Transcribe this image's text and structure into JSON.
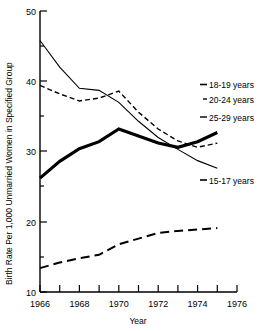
{
  "chart_data": {
    "type": "line",
    "title": "",
    "xlabel": "Year",
    "ylabel": "Birth Rate Per 1,000 Unmarried Women in Specified Group",
    "xlim": [
      1966,
      1976
    ],
    "ylim": [
      10,
      50
    ],
    "yticks": [
      10,
      20,
      30,
      40,
      50
    ],
    "ytick_labels": [
      "10",
      "20",
      "30",
      "40",
      "50"
    ],
    "xticks": [
      1966,
      1967,
      1968,
      1969,
      1970,
      1971,
      1972,
      1973,
      1974,
      1975,
      1976
    ],
    "xtick_labels": [
      "1966",
      "",
      "1968",
      "",
      "1970",
      "",
      "1972",
      "",
      "1974",
      "",
      "1976"
    ],
    "grid": false,
    "legend_position": "right-inline",
    "x": [
      1966,
      1967,
      1968,
      1969,
      1970,
      1971,
      1972,
      1973,
      1974,
      1975
    ],
    "series": [
      {
        "name": "18-19 years",
        "label": "18-19 years",
        "style": "solid-thin",
        "color": "#000000",
        "values": [
          45.8,
          42.0,
          39.0,
          38.7,
          37.0,
          34.3,
          32.0,
          30.3,
          28.7,
          27.6
        ]
      },
      {
        "name": "20-24 years",
        "label": "20-24 years",
        "style": "dashed-short",
        "color": "#000000",
        "values": [
          39.4,
          38.2,
          37.2,
          37.6,
          38.6,
          35.6,
          33.2,
          31.5,
          30.6,
          31.2
        ]
      },
      {
        "name": "25-29 years",
        "label": "25-29 years",
        "style": "solid-thick",
        "color": "#000000",
        "values": [
          26.2,
          28.6,
          30.4,
          31.4,
          33.2,
          32.2,
          31.2,
          30.6,
          31.4,
          32.7
        ]
      },
      {
        "name": "15-17 years",
        "label": "15-17 years",
        "style": "dashed-long",
        "color": "#000000",
        "values": [
          13.4,
          14.2,
          14.8,
          15.3,
          16.8,
          17.6,
          18.4,
          18.7,
          18.9,
          19.1
        ]
      }
    ]
  },
  "axis": {
    "y_title": "Birth Rate Per 1,000 Unmarried Women in Specified Group",
    "x_title": "Year"
  },
  "labels": {
    "y50": "50",
    "y40": "40",
    "y30": "30",
    "y20": "20",
    "y10": "10",
    "x1966": "1966",
    "x1968": "1968",
    "x1970": "1970",
    "x1972": "1972",
    "x1974": "1974",
    "x1976": "1976"
  },
  "legend": {
    "s1": "18-19 years",
    "s2": "20-24 years",
    "s3": "25-29 years",
    "s4": "15-17 years"
  }
}
